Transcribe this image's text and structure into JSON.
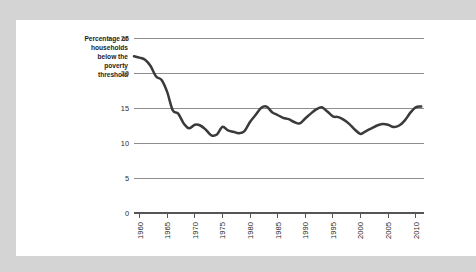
{
  "figure": {
    "background_color": "#d4d4d4",
    "card_color": "#ffffff",
    "line_color": "#3a3a3a",
    "grid_color": "#8d8d8d",
    "axis_color": "#555555"
  },
  "chart_data": {
    "type": "line",
    "title": "",
    "subtitle": "",
    "ylabel": "Percentage of households below the poverty threshold",
    "ylabel_lines": [
      "Percentage of",
      "households",
      "below the",
      "poverty",
      "threshold"
    ],
    "xlabel": "",
    "grid": "horizontal",
    "legend": "none",
    "xlim": [
      1959,
      2011.5
    ],
    "ylim": [
      0,
      25
    ],
    "yticks": [
      0,
      5,
      10,
      15,
      20,
      25
    ],
    "ytick_labels": [
      "0",
      "5",
      "10",
      "15",
      "20",
      "25"
    ],
    "xticks": [
      1960,
      1965,
      1970,
      1975,
      1980,
      1985,
      1990,
      1995,
      2000,
      2005,
      2010
    ],
    "xtick_labels": [
      "1960",
      "1965",
      "1970",
      "1975",
      "1980",
      "1985",
      "1990",
      "1995",
      "2000",
      "2005",
      "2010"
    ],
    "xtick_rotation": 90,
    "series": [
      {
        "name": "Percentage of households below the poverty threshold",
        "x": [
          1959,
          1960,
          1961,
          1962,
          1963,
          1964,
          1965,
          1966,
          1967,
          1968,
          1969,
          1970,
          1971,
          1972,
          1973,
          1974,
          1975,
          1976,
          1977,
          1978,
          1979,
          1980,
          1981,
          1982,
          1983,
          1984,
          1985,
          1986,
          1987,
          1988,
          1989,
          1990,
          1991,
          1992,
          1993,
          1994,
          1995,
          1996,
          1997,
          1998,
          1999,
          2000,
          2001,
          2002,
          2003,
          2004,
          2005,
          2006,
          2007,
          2008,
          2009,
          2010,
          2011
        ],
        "values": [
          22.4,
          22.2,
          21.9,
          21.0,
          19.5,
          19.0,
          17.3,
          14.7,
          14.2,
          12.8,
          12.1,
          12.6,
          12.5,
          11.9,
          11.1,
          11.2,
          12.3,
          11.8,
          11.6,
          11.4,
          11.7,
          13.0,
          14.0,
          15.0,
          15.2,
          14.4,
          14.0,
          13.6,
          13.4,
          13.0,
          12.8,
          13.5,
          14.2,
          14.8,
          15.1,
          14.5,
          13.8,
          13.7,
          13.3,
          12.7,
          11.9,
          11.3,
          11.7,
          12.1,
          12.5,
          12.7,
          12.6,
          12.3,
          12.5,
          13.2,
          14.3,
          15.1,
          15.2
        ]
      }
    ]
  }
}
